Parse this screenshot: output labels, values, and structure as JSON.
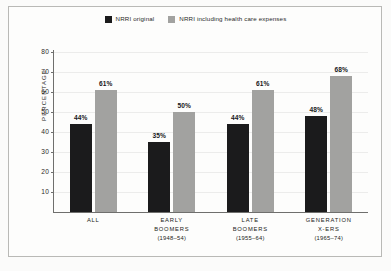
{
  "chart_data": {
    "type": "bar",
    "title": "",
    "subtitle": "",
    "xlabel": "",
    "ylabel": "PERCENTAGE",
    "ylim": [
      0,
      80
    ],
    "ytick_values": [
      80,
      70,
      60,
      50,
      40,
      30,
      20,
      10
    ],
    "ytick_labels": [
      "80",
      "70",
      "60",
      "50",
      "40",
      "30",
      "20",
      "10"
    ],
    "grid": true,
    "grid_axis": "y",
    "legend_position": "top-center",
    "value_label_suffix": "%",
    "categories": [
      "ALL",
      "EARLY BOOMERS (1948–54)",
      "LATE BOOMERS (1955–64)",
      "GENERATION X-ERS (1965–74)"
    ],
    "category_lines": [
      [
        "ALL"
      ],
      [
        "EARLY",
        "BOOMERS",
        "(1948–54)"
      ],
      [
        "LATE",
        "BOOMERS",
        "(1955–64)"
      ],
      [
        "GENERATION",
        "X-ERS",
        "(1965–74)"
      ]
    ],
    "series": [
      {
        "name": "NRRI original",
        "color": "#1b1b1c",
        "values": [
          44,
          35,
          44,
          48
        ],
        "value_labels": [
          "44%",
          "35%",
          "44%",
          "48%"
        ]
      },
      {
        "name": "NRRI including health care expenses",
        "color": "#a2a2a0",
        "values": [
          61,
          50,
          61,
          68
        ],
        "value_labels": [
          "61%",
          "50%",
          "61%",
          "68%"
        ]
      }
    ]
  },
  "legend": {
    "items": [
      {
        "label": "NRRI original",
        "color": "#1b1b1c"
      },
      {
        "label": "NRRI including health care expenses",
        "color": "#a2a2a0"
      }
    ]
  },
  "colors": {
    "page_background": "#fbfbfa",
    "panel_background": "#fdfdfc",
    "frame_border": "#b9b9b6",
    "axis": "#6f6f6d",
    "gridline": "#ececeb",
    "text": "#232321"
  }
}
